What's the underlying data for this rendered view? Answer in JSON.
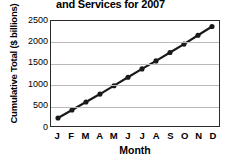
{
  "chart_data": {
    "type": "line",
    "title": "and Services for 2007",
    "xlabel": "Month",
    "ylabel": "Cumulative Total ($ billions)",
    "categories": [
      "J",
      "F",
      "M",
      "A",
      "M",
      "J",
      "J",
      "A",
      "S",
      "O",
      "N",
      "D"
    ],
    "values": [
      190,
      380,
      570,
      760,
      960,
      1160,
      1360,
      1550,
      1750,
      1950,
      2160,
      2370
    ],
    "ylim": [
      0,
      2500
    ],
    "yticks": [
      0,
      500,
      1000,
      1500,
      2000,
      2500
    ],
    "ytick_labels": [
      "0",
      "500",
      "1000",
      "1500",
      "2000",
      "2500"
    ],
    "grid": true,
    "legend": "none",
    "marker": "filled-circle",
    "line_color": "#1a1a1a",
    "marker_color": "#1a1a1a",
    "grid_color": "#b9b9b9",
    "axis_color": "#2b2b2b",
    "background_color": "#ffffff"
  }
}
